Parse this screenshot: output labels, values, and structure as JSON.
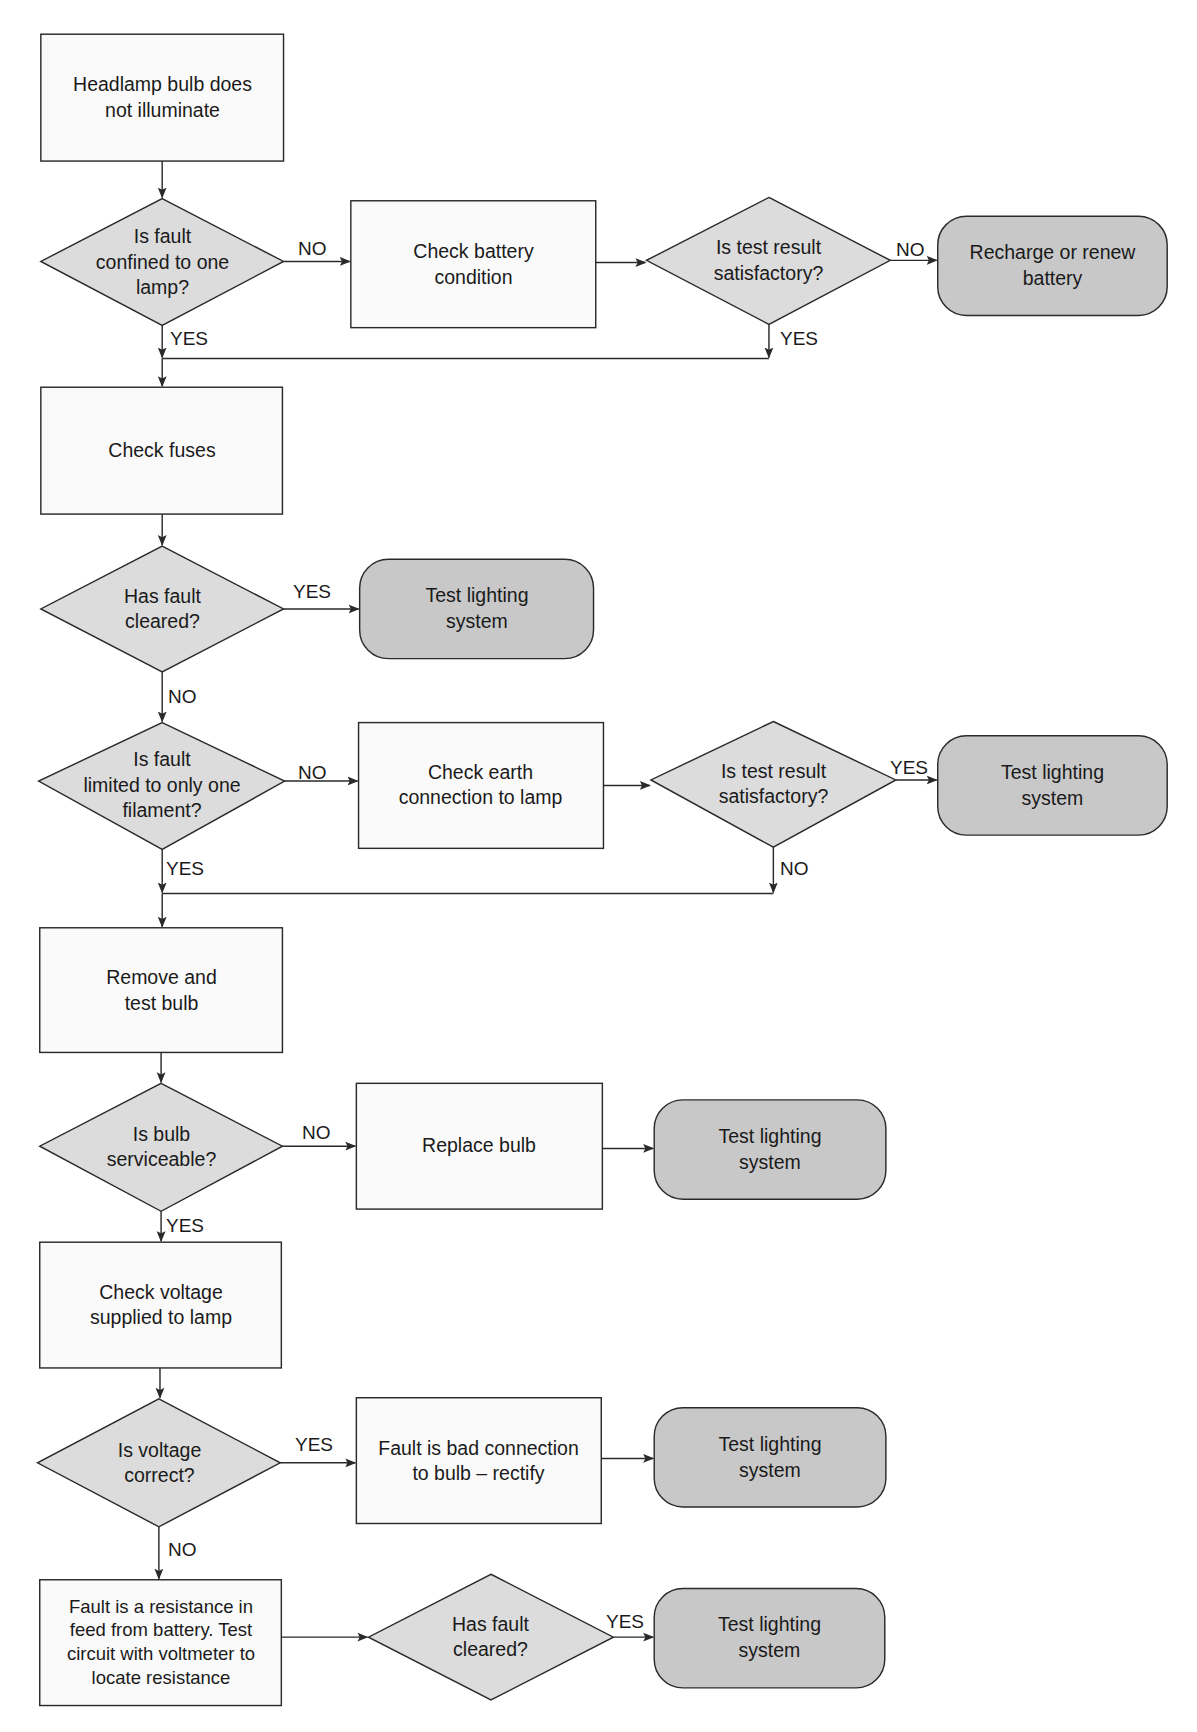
{
  "diagram": {
    "colors": {
      "process_fill": "#fafafa",
      "decision_fill": "#dcdcdc",
      "terminal_fill": "#c8c8c8",
      "stroke": "#2a2a2a"
    },
    "nodes": {
      "start": "Headlamp bulb does\nnot illuminate",
      "d_confined": "Is fault\nconfined to one\nlamp?",
      "check_battery": "Check battery\ncondition",
      "d_battery_test": "Is test result\nsatisfactory?",
      "recharge_battery": "Recharge or renew\nbattery",
      "check_fuses": "Check fuses",
      "d_fuse_cleared": "Has fault\ncleared?",
      "test_lighting_1": "Test lighting\nsystem",
      "d_one_filament": "Is fault\nlimited to only one\nfilament?",
      "check_earth": "Check earth\nconnection to lamp",
      "d_earth_test": "Is test result\nsatisfactory?",
      "test_lighting_2": "Test lighting\nsystem",
      "remove_test_bulb": "Remove and\ntest bulb",
      "d_bulb_serviceable": "Is bulb\nserviceable?",
      "replace_bulb": "Replace bulb",
      "test_lighting_3": "Test lighting\nsystem",
      "check_voltage": "Check voltage\nsupplied to lamp",
      "d_voltage_correct": "Is voltage\ncorrect?",
      "bad_connection": "Fault is bad connection\nto bulb – rectify",
      "test_lighting_4": "Test lighting\nsystem",
      "resistance_feed": "Fault is a resistance in\nfeed from battery. Test\ncircuit with voltmeter to\nlocate resistance",
      "d_final_cleared": "Has fault\ncleared?",
      "test_lighting_5": "Test lighting\nsystem"
    },
    "edge_labels": {
      "confined_no": "NO",
      "confined_yes": "YES",
      "battery_test_no": "NO",
      "battery_test_yes": "YES",
      "fuse_cleared_yes": "YES",
      "fuse_cleared_no": "NO",
      "one_filament_no": "NO",
      "one_filament_yes": "YES",
      "earth_test_yes": "YES",
      "earth_test_no": "NO",
      "bulb_serviceable_no": "NO",
      "bulb_serviceable_yes": "YES",
      "voltage_correct_yes": "YES",
      "voltage_correct_no": "NO",
      "final_cleared_yes": "YES"
    }
  }
}
